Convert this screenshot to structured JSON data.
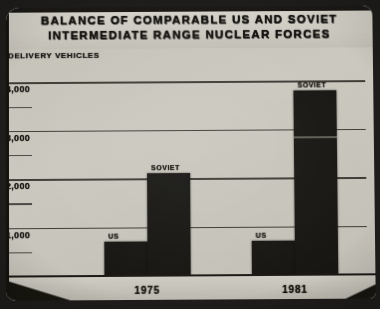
{
  "chart_data": {
    "type": "bar",
    "title": "BALANCE OF COMPARABLE US AND SOVIET INTERMEDIATE RANGE NUCLEAR FORCES",
    "title_line_1": "BALANCE OF COMPARABLE US AND SOVIET",
    "title_line_2": "INTERMEDIATE RANGE NUCLEAR FORCES",
    "ylabel": "DELIVERY VEHICLES",
    "xlabel": "",
    "categories": [
      "1975",
      "1981"
    ],
    "series": [
      {
        "name": "US",
        "values": [
          700,
          700
        ]
      },
      {
        "name": "SOVIET",
        "values": [
          2100,
          3800
        ]
      }
    ],
    "ytick_labels": [
      "4,000",
      "3,000",
      "2,000",
      "1,000"
    ],
    "ytick_values": [
      4000,
      3000,
      2000,
      1000
    ],
    "ylim": [
      0,
      4400
    ],
    "grid": true,
    "minor_ticks": true,
    "legend": "none",
    "annotations": [
      {
        "text": "SOVIET",
        "group": "1975",
        "note": "label above Soviet bar"
      },
      {
        "text": "US",
        "group": "1975",
        "note": "label above US bar"
      },
      {
        "text": "SOVIET",
        "group": "1981",
        "note": "label above Soviet bar"
      },
      {
        "text": "US",
        "group": "1981",
        "note": "label above US bar"
      },
      {
        "value": 2850,
        "group": "1981",
        "series": "SOVIET",
        "note": "horizontal subdivision line inside 1981 Soviet bar"
      }
    ]
  },
  "bars": [
    {
      "label": "US",
      "group": "1975",
      "value": 700
    },
    {
      "label": "SOVIET",
      "group": "1975",
      "value": 2100
    },
    {
      "label": "US",
      "group": "1981",
      "value": 700
    },
    {
      "label": "SOVIET",
      "group": "1981",
      "value": 3800
    }
  ],
  "yticks": [
    {
      "label": "4,000",
      "value": 4000
    },
    {
      "label": "3,000",
      "value": 3000
    },
    {
      "label": "2,000",
      "value": 2000
    },
    {
      "label": "1,000",
      "value": 1000
    }
  ],
  "xticks": [
    {
      "label": "1975"
    },
    {
      "label": "1981"
    }
  ],
  "colors": {
    "bar": "#181714",
    "slide_background": "#c9c6bd",
    "frame": "#1e1d1b",
    "gridline": "#26241f",
    "text": "#14130f"
  }
}
